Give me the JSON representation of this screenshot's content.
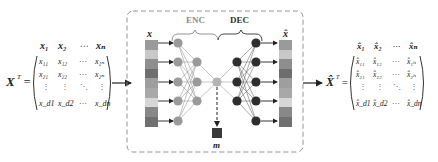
{
  "input_matrix": {
    "label": "X",
    "superscript": "T",
    "equals": "=",
    "column_headers": [
      "x₁",
      "x₂",
      "⋯",
      "xₙ"
    ],
    "rows": [
      [
        "x₁₁",
        "x₁₂",
        "⋯",
        "x₁ₙ"
      ],
      [
        "x₂₁",
        "x₂₂",
        "⋯",
        "x₂ₙ"
      ],
      [
        "⋮",
        "⋮",
        "⋱",
        "⋮"
      ],
      [
        "x_d1",
        "x_d2",
        "⋯",
        "x_dn"
      ]
    ]
  },
  "output_matrix": {
    "label": "X̂",
    "superscript": "T",
    "equals": "=",
    "column_headers": [
      "x̂₁",
      "x̂₂",
      "⋯",
      "x̂ₙ"
    ],
    "rows": [
      [
        "x̂₁₁",
        "x̂₁₂",
        "⋯",
        "x̂₁ₙ"
      ],
      [
        "x̂₂₁",
        "x̂₂₂",
        "⋯",
        "x̂₂ₙ"
      ],
      [
        "⋮",
        "⋮",
        "⋱",
        "⋮"
      ],
      [
        "x̂_d1",
        "x̂_d2",
        "⋯",
        "x̂_dn"
      ]
    ]
  },
  "autoencoder": {
    "input_label": "x",
    "output_label": "x̂",
    "encoder_label": "ENC",
    "decoder_label": "DEC",
    "latent_label": "m",
    "input_bar_colors": [
      "#9a9a9a",
      "#c8c8c8",
      "#8e8e8e",
      "#6e6e6e",
      "#9e9e9e",
      "#a8a8a8",
      "#d6d6d6",
      "#888888",
      "#707070"
    ],
    "output_bar_colors": [
      "#9a9a9a",
      "#c8c8c8",
      "#8e8e8e",
      "#6e6e6e",
      "#9e9e9e",
      "#a8a8a8",
      "#d6d6d6",
      "#888888",
      "#707070"
    ],
    "encoder_node_color": "#9a9a9a",
    "latent_node_color": "#b4b4b4",
    "decoder_node_color": "#2e2e2e",
    "latent_square_color": "#3a3a3a",
    "enc_label_color": "#8a8a8a",
    "dec_label_color": "#333333"
  }
}
